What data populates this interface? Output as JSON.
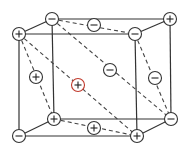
{
  "diagram": {
    "type": "crystal-lattice-unit-cell",
    "vertices": {
      "front_top_left": {
        "x": 19,
        "y": 34,
        "charge": "+"
      },
      "front_top_right": {
        "x": 135,
        "y": 34,
        "charge": "-"
      },
      "front_bottom_right": {
        "x": 137,
        "y": 136,
        "charge": "+"
      },
      "front_bottom_left": {
        "x": 19,
        "y": 136,
        "charge": "-"
      },
      "back_top_left": {
        "x": 52,
        "y": 19,
        "charge": "-"
      },
      "back_top_right": {
        "x": 170,
        "y": 19,
        "charge": "+"
      },
      "back_bottom_right": {
        "x": 171,
        "y": 119,
        "charge": "-"
      },
      "back_bottom_left": {
        "x": 54,
        "y": 119,
        "charge": "+"
      }
    },
    "face_ions": [
      {
        "name": "top-face-ion",
        "x": 94,
        "y": 25,
        "charge": "-"
      },
      {
        "name": "left-face-ion",
        "x": 36,
        "y": 77,
        "charge": "+"
      },
      {
        "name": "diagonal-ion",
        "x": 110,
        "y": 70,
        "charge": "-"
      },
      {
        "name": "right-face-ion",
        "x": 155,
        "y": 78,
        "charge": "-"
      },
      {
        "name": "bottom-face-ion",
        "x": 94,
        "y": 128,
        "charge": "+"
      }
    ],
    "center_ion": {
      "x": 78,
      "y": 85,
      "charge": "+",
      "accent_color": "#c0392b"
    },
    "colors": {
      "line": "#333333",
      "background": "#ffffff",
      "accent": "#c0392b"
    }
  }
}
